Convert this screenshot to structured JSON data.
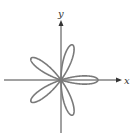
{
  "figure": {
    "type": "polar rose curve",
    "petals": 5,
    "equation_form": "r = cos(5θ)",
    "colors": {
      "axis": "#444444",
      "curve": "#7a7a7a"
    }
  },
  "axes": {
    "x_label": "x",
    "y_label": "y"
  }
}
